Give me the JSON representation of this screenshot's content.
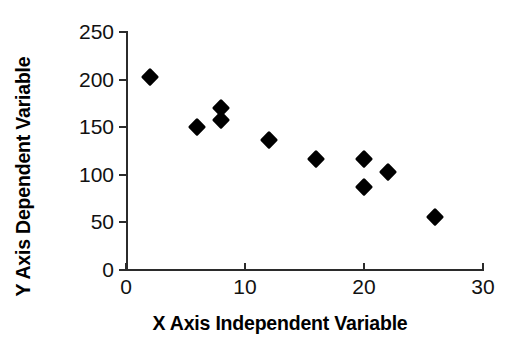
{
  "chart_data": {
    "type": "scatter",
    "title": "",
    "xlabel": "X Axis Independent Variable",
    "ylabel": "Y Axis Dependent Variable",
    "xlim": [
      0,
      30
    ],
    "ylim": [
      0,
      250
    ],
    "xticks": [
      0,
      10,
      20,
      30
    ],
    "yticks": [
      0,
      50,
      100,
      150,
      200,
      250
    ],
    "xtick_labels": [
      "0",
      "10",
      "20",
      "30"
    ],
    "ytick_labels": [
      "0",
      "50",
      "100",
      "150",
      "200",
      "250"
    ],
    "grid": false,
    "legend": false,
    "marker": "diamond",
    "marker_color": "#000000",
    "background_color": "#ffffff",
    "axis_color": "#2b2b2b",
    "series": [
      {
        "name": "observations",
        "points": [
          {
            "x": 2,
            "y": 203
          },
          {
            "x": 6,
            "y": 150
          },
          {
            "x": 8,
            "y": 170
          },
          {
            "x": 8,
            "y": 158
          },
          {
            "x": 12,
            "y": 137
          },
          {
            "x": 16,
            "y": 117
          },
          {
            "x": 20,
            "y": 117
          },
          {
            "x": 20,
            "y": 87
          },
          {
            "x": 22,
            "y": 103
          },
          {
            "x": 26,
            "y": 56
          }
        ]
      }
    ]
  }
}
